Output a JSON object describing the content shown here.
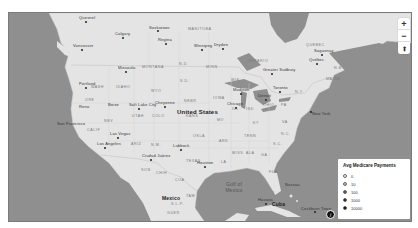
{
  "map": {
    "country_label": "United States",
    "water_labels": [
      {
        "text": "Gulf of\nMexico",
        "x": 224,
        "y": 182
      }
    ],
    "region_labels": [
      {
        "text": "Mexico",
        "x": 161,
        "y": 194,
        "kind": "country2"
      },
      {
        "text": "Cuba",
        "x": 271,
        "y": 200,
        "kind": "country2"
      },
      {
        "text": "ONTARIO",
        "x": 247,
        "y": 58,
        "kind": "state"
      },
      {
        "text": "QUEBEC",
        "x": 305,
        "y": 42,
        "kind": "state"
      },
      {
        "text": "MANITOBA",
        "x": 187,
        "y": 26,
        "kind": "state"
      },
      {
        "text": "WASH",
        "x": 90,
        "y": 84,
        "kind": "state"
      },
      {
        "text": "MONTANA",
        "x": 141,
        "y": 64,
        "kind": "state"
      },
      {
        "text": "IDAHO",
        "x": 115,
        "y": 84,
        "kind": "state"
      },
      {
        "text": "ORE",
        "x": 84,
        "y": 97,
        "kind": "state"
      },
      {
        "text": "NEV",
        "x": 103,
        "y": 118,
        "kind": "state"
      },
      {
        "text": "UTAH",
        "x": 131,
        "y": 113,
        "kind": "state"
      },
      {
        "text": "CALIF",
        "x": 86,
        "y": 127,
        "kind": "state"
      },
      {
        "text": "ARIZ",
        "x": 130,
        "y": 141,
        "kind": "state"
      },
      {
        "text": "N.M.",
        "x": 150,
        "y": 142,
        "kind": "state"
      },
      {
        "text": "COLO",
        "x": 151,
        "y": 113,
        "kind": "state"
      },
      {
        "text": "WYO",
        "x": 150,
        "y": 88,
        "kind": "state"
      },
      {
        "text": "S.D.",
        "x": 179,
        "y": 78,
        "kind": "state"
      },
      {
        "text": "N.D.",
        "x": 178,
        "y": 61,
        "kind": "state"
      },
      {
        "text": "MINN",
        "x": 205,
        "y": 64,
        "kind": "state"
      },
      {
        "text": "NEBR",
        "x": 183,
        "y": 98,
        "kind": "state"
      },
      {
        "text": "KANS",
        "x": 185,
        "y": 113,
        "kind": "state"
      },
      {
        "text": "OKLA",
        "x": 192,
        "y": 133,
        "kind": "state"
      },
      {
        "text": "TEXAS",
        "x": 185,
        "y": 158,
        "kind": "state"
      },
      {
        "text": "IOWA",
        "x": 212,
        "y": 95,
        "kind": "state"
      },
      {
        "text": "MO",
        "x": 216,
        "y": 117,
        "kind": "state"
      },
      {
        "text": "ARK",
        "x": 218,
        "y": 138,
        "kind": "state"
      },
      {
        "text": "LA",
        "x": 220,
        "y": 159,
        "kind": "state"
      },
      {
        "text": "WIS",
        "x": 230,
        "y": 77,
        "kind": "state"
      },
      {
        "text": "ILL",
        "x": 231,
        "y": 106,
        "kind": "state"
      },
      {
        "text": "IND",
        "x": 245,
        "y": 106,
        "kind": "state"
      },
      {
        "text": "OHIO",
        "x": 262,
        "y": 102,
        "kind": "state"
      },
      {
        "text": "KY",
        "x": 252,
        "y": 120,
        "kind": "state"
      },
      {
        "text": "TENN",
        "x": 243,
        "y": 133,
        "kind": "state"
      },
      {
        "text": "MISS",
        "x": 231,
        "y": 150,
        "kind": "state"
      },
      {
        "text": "ALA",
        "x": 245,
        "y": 150,
        "kind": "state"
      },
      {
        "text": "GA",
        "x": 260,
        "y": 152,
        "kind": "state"
      },
      {
        "text": "FLA",
        "x": 268,
        "y": 169,
        "kind": "state"
      },
      {
        "text": "S.C.",
        "x": 272,
        "y": 141,
        "kind": "state"
      },
      {
        "text": "N.C.",
        "x": 280,
        "y": 131,
        "kind": "state"
      },
      {
        "text": "VA",
        "x": 281,
        "y": 119,
        "kind": "state"
      },
      {
        "text": "PA",
        "x": 280,
        "y": 102,
        "kind": "state"
      },
      {
        "text": "N.Y.",
        "x": 294,
        "y": 89,
        "kind": "state"
      },
      {
        "text": "MAINE",
        "x": 325,
        "y": 76,
        "kind": "state"
      },
      {
        "text": "N.B.",
        "x": 333,
        "y": 65,
        "kind": "state"
      },
      {
        "text": "SON",
        "x": 140,
        "y": 167,
        "kind": "state"
      },
      {
        "text": "CHIH",
        "x": 155,
        "y": 170,
        "kind": "state"
      },
      {
        "text": "COA",
        "x": 174,
        "y": 177,
        "kind": "state"
      },
      {
        "text": "TAM",
        "x": 185,
        "y": 193,
        "kind": "state"
      },
      {
        "text": "S.L.P.",
        "x": 170,
        "y": 201,
        "kind": "state"
      },
      {
        "text": "GUER",
        "x": 166,
        "y": 210,
        "kind": "state"
      }
    ],
    "cities": [
      {
        "name": "Quesnel",
        "x": 78,
        "y": 16
      },
      {
        "name": "Calgary",
        "x": 114,
        "y": 30
      },
      {
        "name": "Saskatoon",
        "x": 148,
        "y": 24
      },
      {
        "name": "Regina",
        "x": 157,
        "y": 36
      },
      {
        "name": "Winnipeg",
        "x": 193,
        "y": 42
      },
      {
        "name": "Dryden",
        "x": 213,
        "y": 42
      },
      {
        "name": "Vancouver",
        "x": 72,
        "y": 46
      },
      {
        "name": "Missoula",
        "x": 117,
        "y": 64
      },
      {
        "name": "Portland",
        "x": 78,
        "y": 80
      },
      {
        "name": "Boise",
        "x": 105,
        "y": 101
      },
      {
        "name": "Salt Lake City",
        "x": 129,
        "y": 101
      },
      {
        "name": "Cheyenne",
        "x": 154,
        "y": 99
      },
      {
        "name": "Reno",
        "x": 76,
        "y": 103
      },
      {
        "name": "San Francisco",
        "x": 58,
        "y": 120
      },
      {
        "name": "Las Vegas",
        "x": 109,
        "y": 130
      },
      {
        "name": "Los Angeles",
        "x": 96,
        "y": 140
      },
      {
        "name": "Lubbock",
        "x": 172,
        "y": 142
      },
      {
        "name": "Ciudad Juárez",
        "x": 142,
        "y": 152
      },
      {
        "name": "Houston",
        "x": 196,
        "y": 159
      },
      {
        "name": "Madison",
        "x": 232,
        "y": 86
      },
      {
        "name": "Chicago",
        "x": 226,
        "y": 100
      },
      {
        "name": "Detroit",
        "x": 257,
        "y": 92
      },
      {
        "name": "Toronto",
        "x": 271,
        "y": 84
      },
      {
        "name": "Greater Sudbury",
        "x": 262,
        "y": 66
      },
      {
        "name": "Québec",
        "x": 308,
        "y": 56
      },
      {
        "name": "Saguenay",
        "x": 313,
        "y": 47
      },
      {
        "name": "New York",
        "x": 303,
        "y": 108
      },
      {
        "name": "Havana",
        "x": 257,
        "y": 196
      },
      {
        "name": "Nassau",
        "x": 282,
        "y": 181
      },
      {
        "name": "Cockburn Town",
        "x": 305,
        "y": 200
      }
    ]
  },
  "zoom_controls": {
    "zoom_in": "+",
    "zoom_out": "−",
    "reset_north": "⬆"
  },
  "legend": {
    "title": "Avg Medicare Payments",
    "items": [
      {
        "label": "0",
        "color": "#f2f2f2"
      },
      {
        "label": "10",
        "color": "#bbbbbb"
      },
      {
        "label": "100",
        "color": "#555555"
      },
      {
        "label": "1000",
        "color": "#1a1a1a"
      },
      {
        "label": "10000",
        "color": "#000000"
      }
    ]
  },
  "info_button": {
    "label": "i"
  },
  "colors": {
    "water": "#8f8f8f",
    "land": "#e6e6e6",
    "legend_bg": "#ffffff"
  }
}
